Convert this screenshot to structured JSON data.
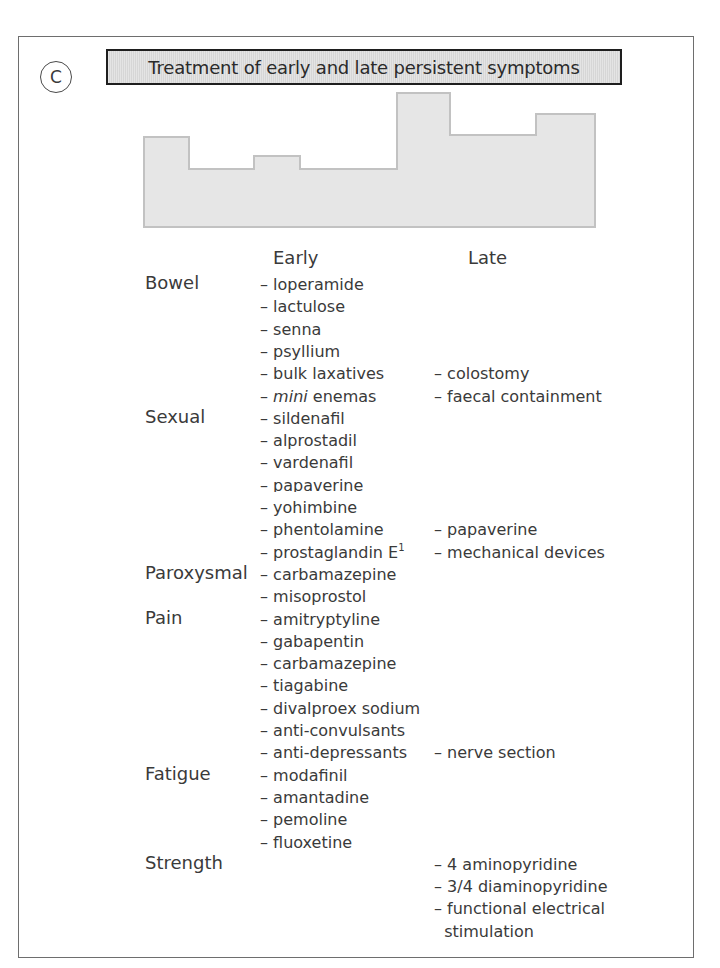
{
  "figure": {
    "panel_label": "C",
    "title": "Treatment of early and late persistent symptoms",
    "columns": {
      "early": "Early",
      "late": "Late"
    },
    "colors": {
      "frame_border": "#6e6e6e",
      "title_border": "#1e1e1e",
      "title_fill": "#d6d6d6",
      "silhouette_fill": "#e6e6e6",
      "silhouette_stroke": "#c2c2c2",
      "text": "#3a3a3a"
    },
    "silhouette_points": [
      [
        144,
        227
      ],
      [
        144,
        137
      ],
      [
        189,
        137
      ],
      [
        189,
        169
      ],
      [
        254,
        169
      ],
      [
        254,
        156
      ],
      [
        300,
        156
      ],
      [
        300,
        169
      ],
      [
        397,
        169
      ],
      [
        397,
        93
      ],
      [
        450,
        93
      ],
      [
        450,
        135
      ],
      [
        536,
        135
      ],
      [
        536,
        114
      ],
      [
        595,
        114
      ],
      [
        595,
        227
      ]
    ],
    "row_top": 275,
    "row_pitch": 22.3,
    "categories": [
      {
        "label": "Bowel",
        "row": 0
      },
      {
        "label": "Sexual",
        "row": 6
      },
      {
        "label": "Paroxysmal",
        "row": 13
      },
      {
        "label": "Pain",
        "row": 15
      },
      {
        "label": "Fatigue",
        "row": 22
      },
      {
        "label": "Strength",
        "row": 26
      }
    ],
    "early": [
      {
        "prefix": "– ",
        "text": "loperamide",
        "row": 0
      },
      {
        "prefix": "– ",
        "text": "lactulose",
        "row": 1
      },
      {
        "prefix": "– ",
        "text": "senna",
        "row": 2
      },
      {
        "prefix": "– ",
        "text": "psyllium",
        "row": 3
      },
      {
        "prefix": "– ",
        "text": "bulk laxatives",
        "row": 4
      },
      {
        "prefix": "– ",
        "italic": "mini",
        "text": " enemas",
        "row": 5
      },
      {
        "prefix": "– ",
        "text": "sildenafil",
        "row": 6
      },
      {
        "prefix": "– ",
        "text": "alprostadil",
        "row": 7
      },
      {
        "prefix": "– ",
        "text": "vardenafil",
        "row": 8
      },
      {
        "prefix": "– ",
        "text": "papaverine",
        "row": 9,
        "clipped": true
      },
      {
        "prefix": "– ",
        "text": "yohimbine",
        "row": 10
      },
      {
        "prefix": "– ",
        "text": "phentolamine",
        "row": 11
      },
      {
        "prefix": "– ",
        "text": "prostaglandin E",
        "sup": "1",
        "row": 12
      },
      {
        "prefix": "– ",
        "text": "carbamazepine",
        "row": 13
      },
      {
        "prefix": "– ",
        "text": "misoprostol",
        "row": 14
      },
      {
        "prefix": "– ",
        "text": "amitryptyline",
        "row": 15
      },
      {
        "prefix": "– ",
        "text": "gabapentin",
        "row": 16
      },
      {
        "prefix": "– ",
        "text": "carbamazepine",
        "row": 17
      },
      {
        "prefix": "– ",
        "text": "tiagabine",
        "row": 18
      },
      {
        "prefix": "– ",
        "text": "divalproex sodium",
        "row": 19
      },
      {
        "prefix": "– ",
        "text": "anti-convulsants",
        "row": 20
      },
      {
        "prefix": "– ",
        "text": "anti-depressants",
        "row": 21
      },
      {
        "prefix": "– ",
        "text": "modafinil",
        "row": 22
      },
      {
        "prefix": "– ",
        "text": "amantadine",
        "row": 23
      },
      {
        "prefix": "– ",
        "text": "pemoline",
        "row": 24
      },
      {
        "prefix": "– ",
        "text": "fluoxetine",
        "row": 25
      }
    ],
    "late": [
      {
        "prefix": "– ",
        "text": "colostomy",
        "row": 4
      },
      {
        "prefix": "– ",
        "text": "faecal containment",
        "row": 5
      },
      {
        "prefix": "– ",
        "text": "papaverine",
        "row": 11
      },
      {
        "prefix": "– ",
        "text": "mechanical devices",
        "row": 12
      },
      {
        "prefix": "– ",
        "text": "nerve section",
        "row": 21
      },
      {
        "prefix": "– ",
        "text": "4 aminopyridine",
        "row": 26
      },
      {
        "prefix": "– ",
        "text": "3/4 diaminopyridine",
        "row": 27
      },
      {
        "prefix": "– ",
        "text": "functional electrical",
        "row": 28
      },
      {
        "prefix": "  ",
        "text": "stimulation",
        "row": 29
      }
    ]
  }
}
